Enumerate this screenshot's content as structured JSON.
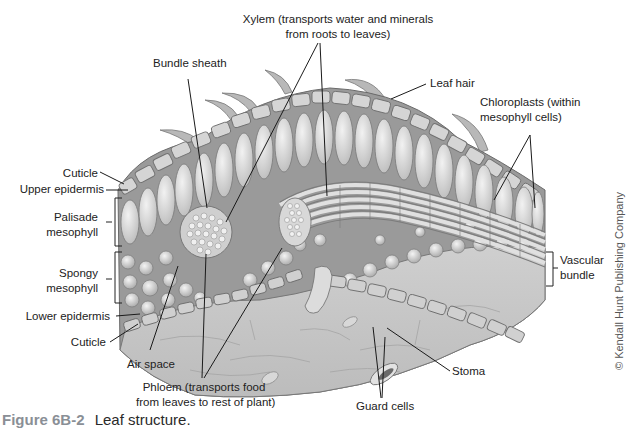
{
  "figure": {
    "caption_number": "Figure 6B-2",
    "caption_text": "Leaf structure.",
    "credit": "© Kendall Hunt Publishing Company",
    "colors": {
      "caption_number": "#8a8f96",
      "tissue_light": "#e6e6e6",
      "tissue_mid": "#bdbdbd",
      "tissue_dark": "#8c8c8c",
      "outline": "#6e6e6e",
      "leader_line": "#1a1a1a"
    }
  },
  "labels": {
    "xylem_line1": "Xylem (transports water and minerals",
    "xylem_line2": "from roots to leaves)",
    "bundle_sheath": "Bundle sheath",
    "leaf_hair": "Leaf hair",
    "chloroplasts_line1": "Chloroplasts (within",
    "chloroplasts_line2": "mesophyll cells)",
    "cuticle_top": "Cuticle",
    "upper_epidermis": "Upper epidermis",
    "palisade_line1": "Palisade",
    "palisade_line2": "mesophyll",
    "spongy_line1": "Spongy",
    "spongy_line2": "mesophyll",
    "vascular_line1": "Vascular",
    "vascular_line2": "bundle",
    "lower_epidermis": "Lower epidermis",
    "cuticle_bottom": "Cuticle",
    "air_space": "Air space",
    "phloem_line1": "Phloem (transports food",
    "phloem_line2": "from leaves to rest of plant)",
    "stoma": "Stoma",
    "guard_cells": "Guard cells"
  }
}
